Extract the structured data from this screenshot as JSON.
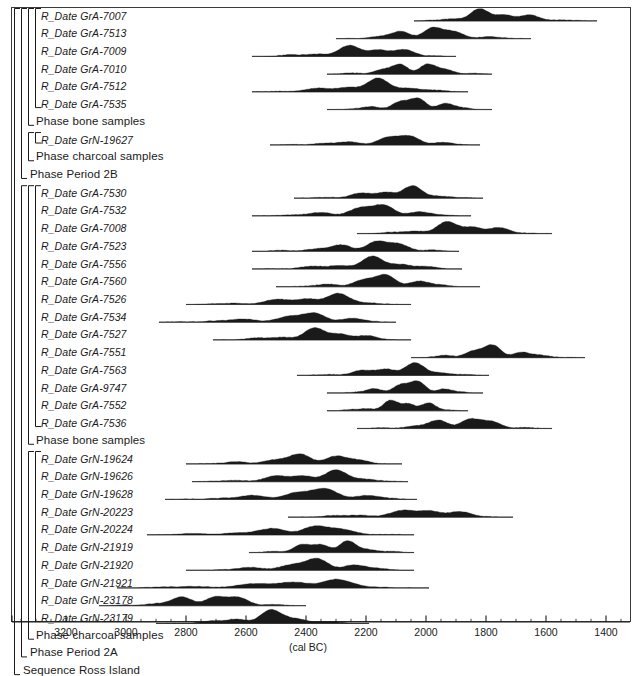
{
  "figure": {
    "kind": "oxcal-multiplot",
    "axis_title": "(cal BC)",
    "frame_color": "#3a3a3a",
    "curve_color": "#1a1a1a",
    "background": "#ffffff"
  },
  "axis": {
    "label": "(cal BC)",
    "direction": "reversed",
    "domain_start": 3380,
    "domain_end": 1320,
    "major_step": 200,
    "minor_step": 50,
    "ticks": [
      {
        "value": 3200,
        "label": "3200"
      },
      {
        "value": 3000,
        "label": "3000"
      },
      {
        "value": 2800,
        "label": "2800"
      },
      {
        "value": 2600,
        "label": "2600"
      },
      {
        "value": 2400,
        "label": "2400"
      },
      {
        "value": 2200,
        "label": "2200"
      },
      {
        "value": 2000,
        "label": "2000"
      },
      {
        "value": 1800,
        "label": "1800"
      },
      {
        "value": 1600,
        "label": "1600"
      },
      {
        "value": 1400,
        "label": "1400"
      }
    ]
  },
  "chart_data": {
    "type": "area",
    "title": "",
    "xlabel": "(cal BC)",
    "ylabel": "",
    "xlim": [
      3380,
      1320
    ],
    "grid": false,
    "legend": "none",
    "rows": [
      {
        "index": 0,
        "type": "R_Date",
        "label": "R_Date GrA-7007",
        "range_start": 2040,
        "range_end": 1430,
        "peak_start": 1920,
        "peak_end": 1680
      },
      {
        "index": 1,
        "type": "R_Date",
        "label": "R_Date GrA-7513",
        "range_start": 2300,
        "range_end": 1650,
        "peak_start": 2120,
        "peak_end": 1880
      },
      {
        "index": 2,
        "type": "R_Date",
        "label": "R_Date GrA-7009",
        "range_start": 2580,
        "range_end": 1900,
        "peak_start": 2300,
        "peak_end": 2020
      },
      {
        "index": 3,
        "type": "R_Date",
        "label": "R_Date GrA-7010",
        "range_start": 2330,
        "range_end": 1780,
        "peak_start": 2140,
        "peak_end": 1920
      },
      {
        "index": 4,
        "type": "R_Date",
        "label": "R_Date GrA-7512",
        "range_start": 2580,
        "range_end": 1860,
        "peak_start": 2280,
        "peak_end": 2010
      },
      {
        "index": 5,
        "type": "R_Date",
        "label": "R_Date GrA-7535",
        "range_start": 2330,
        "range_end": 1780,
        "peak_start": 2120,
        "peak_end": 1900
      },
      {
        "index": 6,
        "type": "Phase",
        "label": "Phase bone samples"
      },
      {
        "index": 7,
        "type": "R_Date",
        "label": "R_Date GrN-19627",
        "range_start": 2520,
        "range_end": 1820,
        "peak_start": 2150,
        "peak_end": 1940
      },
      {
        "index": 8,
        "type": "Phase",
        "label": "Phase charcoal samples"
      },
      {
        "index": 9,
        "type": "Phase",
        "label": "Phase Period 2B"
      },
      {
        "index": 10,
        "type": "R_Date",
        "label": "R_Date GrA-7530",
        "range_start": 2440,
        "range_end": 1810,
        "peak_start": 2180,
        "peak_end": 1960
      },
      {
        "index": 11,
        "type": "R_Date",
        "label": "R_Date GrA-7532",
        "range_start": 2580,
        "range_end": 1850,
        "peak_start": 2260,
        "peak_end": 2010
      },
      {
        "index": 12,
        "type": "R_Date",
        "label": "R_Date GrA-7008",
        "range_start": 2230,
        "range_end": 1580,
        "peak_start": 1990,
        "peak_end": 1740
      },
      {
        "index": 13,
        "type": "R_Date",
        "label": "R_Date GrA-7523",
        "range_start": 2580,
        "range_end": 1890,
        "peak_start": 2270,
        "peak_end": 2000
      },
      {
        "index": 14,
        "type": "R_Date",
        "label": "R_Date GrA-7556",
        "range_start": 2580,
        "range_end": 1880,
        "peak_start": 2260,
        "peak_end": 2000
      },
      {
        "index": 15,
        "type": "R_Date",
        "label": "R_Date GrA-7560",
        "range_start": 2500,
        "range_end": 1820,
        "peak_start": 2240,
        "peak_end": 2000
      },
      {
        "index": 16,
        "type": "R_Date",
        "label": "R_Date GrA-7526",
        "range_start": 2800,
        "range_end": 2050,
        "peak_start": 2440,
        "peak_end": 2190
      },
      {
        "index": 17,
        "type": "R_Date",
        "label": "R_Date GrA-7534",
        "range_start": 2890,
        "range_end": 2100,
        "peak_start": 2450,
        "peak_end": 2190
      },
      {
        "index": 18,
        "type": "R_Date",
        "label": "R_Date GrA-7527",
        "range_start": 2710,
        "range_end": 2050,
        "peak_start": 2430,
        "peak_end": 2190
      },
      {
        "index": 19,
        "type": "R_Date",
        "label": "R_Date GrA-7551",
        "range_start": 2050,
        "range_end": 1470,
        "peak_start": 1890,
        "peak_end": 1680
      },
      {
        "index": 20,
        "type": "R_Date",
        "label": "R_Date GrA-7563",
        "range_start": 2430,
        "range_end": 1790,
        "peak_start": 2180,
        "peak_end": 1950
      },
      {
        "index": 21,
        "type": "R_Date",
        "label": "R_Date GrA-9747",
        "range_start": 2330,
        "range_end": 1810,
        "peak_start": 2140,
        "peak_end": 1930
      },
      {
        "index": 22,
        "type": "R_Date",
        "label": "R_Date GrA-7552",
        "range_start": 2330,
        "range_end": 1860,
        "peak_start": 2150,
        "peak_end": 1950
      },
      {
        "index": 23,
        "type": "R_Date",
        "label": "R_Date GrA-7536",
        "range_start": 2230,
        "range_end": 1580,
        "peak_start": 1980,
        "peak_end": 1740
      },
      {
        "index": 24,
        "type": "Phase",
        "label": "Phase bone samples"
      },
      {
        "index": 25,
        "type": "R_Date",
        "label": "R_Date GrN-19624",
        "range_start": 2800,
        "range_end": 2080,
        "peak_start": 2470,
        "peak_end": 2180
      },
      {
        "index": 26,
        "type": "R_Date",
        "label": "R_Date GrN-19626",
        "range_start": 2780,
        "range_end": 2060,
        "peak_start": 2460,
        "peak_end": 2140
      },
      {
        "index": 27,
        "type": "R_Date",
        "label": "R_Date GrN-19628",
        "range_start": 2870,
        "range_end": 2030,
        "peak_start": 2470,
        "peak_end": 2130
      },
      {
        "index": 28,
        "type": "R_Date",
        "label": "R_Date GrN-20223",
        "range_start": 2460,
        "range_end": 1710,
        "peak_start": 2060,
        "peak_end": 1860
      },
      {
        "index": 29,
        "type": "R_Date",
        "label": "R_Date GrN-20224",
        "range_start": 2930,
        "range_end": 2040,
        "peak_start": 2490,
        "peak_end": 2250
      },
      {
        "index": 30,
        "type": "R_Date",
        "label": "R_Date GrN-21919",
        "range_start": 2590,
        "range_end": 2040,
        "peak_start": 2460,
        "peak_end": 2180
      },
      {
        "index": 31,
        "type": "R_Date",
        "label": "R_Date GrN-21920",
        "range_start": 2800,
        "range_end": 2040,
        "peak_start": 2460,
        "peak_end": 2180
      },
      {
        "index": 32,
        "type": "R_Date",
        "label": "R_Date GrN-21921",
        "range_start": 3030,
        "range_end": 1990,
        "peak_start": 2480,
        "peak_end": 2230
      },
      {
        "index": 33,
        "type": "R_Date",
        "label": "R_Date GrN-23178",
        "range_start": 3090,
        "range_end": 2400,
        "peak_start": 2840,
        "peak_end": 2570
      },
      {
        "index": 34,
        "type": "R_Date",
        "label": "R_Date GrN-23179",
        "range_start": 2900,
        "range_end": 2190,
        "peak_start": 2620,
        "peak_end": 2400
      },
      {
        "index": 35,
        "type": "Phase",
        "label": "Phase charcoal samples"
      },
      {
        "index": 36,
        "type": "Phase",
        "label": "Phase Period 2A"
      },
      {
        "index": 37,
        "type": "Sequence",
        "label": "Sequence Ross Island"
      }
    ]
  }
}
